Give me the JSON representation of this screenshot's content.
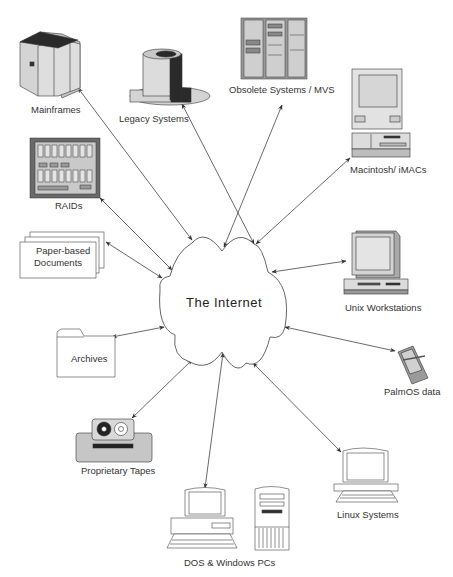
{
  "center": {
    "label": "The Internet"
  },
  "nodes": [
    {
      "id": "mainframes",
      "label": "Mainframes",
      "icon": "mainframe-icon"
    },
    {
      "id": "legacy",
      "label": "Legacy Systems",
      "icon": "legacy-system-icon"
    },
    {
      "id": "obsolete",
      "label": "Obsolete Systems / MVS",
      "icon": "server-rack-icon"
    },
    {
      "id": "mac",
      "label": "Macintosh/ iMACs",
      "icon": "macintosh-icon"
    },
    {
      "id": "raids",
      "label": "RAIDs",
      "icon": "raid-array-icon"
    },
    {
      "id": "paper",
      "label_line1": "Paper-based",
      "label_line2": "Documents",
      "icon": "documents-icon"
    },
    {
      "id": "unix",
      "label": "Unix  Workstations",
      "icon": "workstation-icon"
    },
    {
      "id": "archives",
      "label": "Archives",
      "icon": "folder-icon"
    },
    {
      "id": "palm",
      "label": "PalmOS data",
      "icon": "pda-icon"
    },
    {
      "id": "tapes",
      "label": "Proprietary Tapes",
      "icon": "tape-drive-icon"
    },
    {
      "id": "linux",
      "label": "Linux Systems",
      "icon": "linux-terminal-icon"
    },
    {
      "id": "pcs",
      "label": "DOS & Windows PCs",
      "icon": "pc-tower-icon"
    }
  ],
  "edges": [
    {
      "from": "The Internet",
      "to": "Mainframes",
      "type": "bidirectional"
    },
    {
      "from": "The Internet",
      "to": "Legacy Systems",
      "type": "bidirectional"
    },
    {
      "from": "The Internet",
      "to": "Obsolete Systems / MVS",
      "type": "bidirectional"
    },
    {
      "from": "The Internet",
      "to": "Macintosh/ iMACs",
      "type": "bidirectional"
    },
    {
      "from": "The Internet",
      "to": "RAIDs",
      "type": "bidirectional"
    },
    {
      "from": "The Internet",
      "to": "Paper-based Documents",
      "type": "bidirectional"
    },
    {
      "from": "The Internet",
      "to": "Unix  Workstations",
      "type": "bidirectional"
    },
    {
      "from": "The Internet",
      "to": "Archives",
      "type": "bidirectional"
    },
    {
      "from": "The Internet",
      "to": "PalmOS data",
      "type": "bidirectional"
    },
    {
      "from": "The Internet",
      "to": "Proprietary Tapes",
      "type": "bidirectional"
    },
    {
      "from": "The Internet",
      "to": "Linux Systems",
      "type": "bidirectional"
    },
    {
      "from": "The Internet",
      "to": "DOS & Windows PCs",
      "type": "bidirectional"
    }
  ],
  "colors": {
    "line": "#444444",
    "dark": "#2a2a2a",
    "mid": "#9a9a9a",
    "light": "#d8d8d8",
    "panel": "#bdbdbd"
  }
}
